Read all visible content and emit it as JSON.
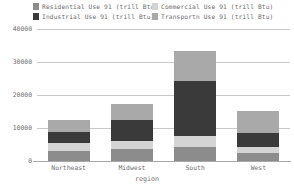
{
  "chart_data": {
    "type": "bar",
    "title": "",
    "subtitle": "",
    "xlabel": "region",
    "ylabel": "",
    "categories": [
      "Northeast",
      "Midwest",
      "South",
      "West"
    ],
    "ylim": [
      0,
      40000
    ],
    "yticks": [
      0,
      10000,
      20000,
      30000,
      40000
    ],
    "ytick_labels": [
      "0",
      "10000",
      "20000",
      "30000",
      "40000"
    ],
    "grid": true,
    "stacked": true,
    "legend_position": "top",
    "bar_order_bottom_to_top": [
      "Residential",
      "Commercial",
      "Industrial",
      "Transportn"
    ],
    "series": [
      {
        "name": "Residential Use 91 (trill Btu)",
        "short": "Residential",
        "color": "#8c8c8c",
        "values": [
          3100,
          3500,
          4200,
          2300
        ]
      },
      {
        "name": "Commercial Use 91 (trill Btu)",
        "short": "Commercial",
        "color": "#d4d4d4",
        "values": [
          2400,
          2600,
          3400,
          2000
        ]
      },
      {
        "name": "Industrial Use 91 (trill Btu)",
        "short": "Industrial",
        "color": "#3a3a3a",
        "values": [
          3200,
          6400,
          16500,
          4300
        ]
      },
      {
        "name": "Transportn Use 91 (trill Btu)",
        "short": "Transportn",
        "color": "#a9a9a9",
        "values": [
          3700,
          4900,
          9300,
          6500
        ]
      }
    ],
    "totals": [
      12400,
      17400,
      33400,
      15100
    ],
    "axis_color": "#a8a8a8",
    "grid_color": "#c9c9c9",
    "text_color": "#6e6e6e",
    "background": "#ffffff"
  },
  "legend": {
    "entries": [
      {
        "label": "Residential Use 91 (trill Btu)",
        "color": "#8c8c8c"
      },
      {
        "label": "Commercial Use 91 (trill Btu)",
        "color": "#d4d4d4"
      },
      {
        "label": "Industrial Use 91 (trill Btu)",
        "color": "#3a3a3a"
      },
      {
        "label": "Transportn Use 91 (trill Btu)",
        "color": "#a9a9a9"
      }
    ]
  }
}
